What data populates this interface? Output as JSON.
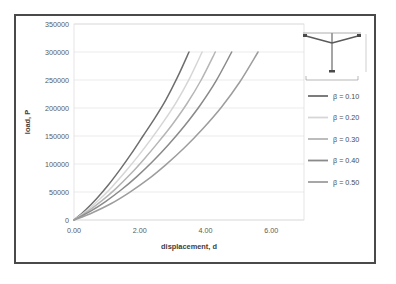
{
  "chart_data": {
    "type": "line",
    "title": "",
    "xlabel": "displacement, d",
    "ylabel": "load, P",
    "xlim": [
      0,
      7
    ],
    "ylim": [
      0,
      350000
    ],
    "grid": true,
    "legend_position": "right",
    "xticks": [
      "0.00",
      "2.00",
      "4.00",
      "6.00"
    ],
    "xtick_values": [
      0,
      2,
      4,
      6
    ],
    "yticks": [
      "0",
      "50000",
      "100000",
      "150000",
      "200000",
      "250000",
      "300000",
      "350000"
    ],
    "ytick_values": [
      0,
      50000,
      100000,
      150000,
      200000,
      250000,
      300000,
      350000
    ],
    "series": [
      {
        "name": "β = 0.10",
        "color": "#6e6e6e",
        "x": [
          0.0,
          0.35,
          0.7,
          1.05,
          1.4,
          1.75,
          2.1,
          2.45,
          2.8,
          3.15,
          3.5
        ],
        "y": [
          0,
          18000,
          39000,
          63000,
          90000,
          119000,
          150000,
          181000,
          215000,
          255000,
          300000
        ]
      },
      {
        "name": "β = 0.20",
        "color": "#d6d6d6",
        "x": [
          0.0,
          0.39,
          0.78,
          1.17,
          1.56,
          1.95,
          2.34,
          2.73,
          3.12,
          3.51,
          3.9
        ],
        "y": [
          0,
          17000,
          37000,
          60000,
          86000,
          114000,
          144000,
          176000,
          211000,
          252000,
          300000
        ]
      },
      {
        "name": "β = 0.30",
        "color": "#b5b5b5",
        "x": [
          0.0,
          0.43,
          0.86,
          1.29,
          1.72,
          2.15,
          2.58,
          3.01,
          3.44,
          3.87,
          4.3
        ],
        "y": [
          0,
          16000,
          35000,
          57000,
          82000,
          110000,
          140000,
          172000,
          208000,
          250000,
          300000
        ]
      },
      {
        "name": "β = 0.40",
        "color": "#8a8a8a",
        "x": [
          0.0,
          0.48,
          0.96,
          1.44,
          1.92,
          2.4,
          2.88,
          3.36,
          3.84,
          4.32,
          4.8
        ],
        "y": [
          0,
          15000,
          33000,
          54000,
          78000,
          105000,
          135000,
          168000,
          205000,
          248000,
          300000
        ]
      },
      {
        "name": "β = 0.50",
        "color": "#9d9d9d",
        "x": [
          0.0,
          0.56,
          1.12,
          1.68,
          2.24,
          2.8,
          3.36,
          3.92,
          4.48,
          5.04,
          5.6
        ],
        "y": [
          0,
          13000,
          29000,
          49000,
          72000,
          99000,
          129000,
          163000,
          201000,
          246000,
          300000
        ]
      }
    ]
  },
  "legend": {
    "entries": [
      {
        "label": "β = 0.10",
        "color": "#6e6e6e"
      },
      {
        "label": "β = 0.20",
        "color": "#d6d6d6"
      },
      {
        "label": "β = 0.30",
        "color": "#b5b5b5"
      },
      {
        "label": "β = 0.40",
        "color": "#8a8a8a"
      },
      {
        "label": "β = 0.50",
        "color": "#9d9d9d"
      }
    ]
  },
  "schematic": {
    "name": "cable-mast-structure"
  },
  "colors": {
    "frame_border": "#4a4a4a",
    "gridline": "#e2e2e2",
    "axis_text": "#5a5a5a",
    "background": "#ffffff"
  }
}
